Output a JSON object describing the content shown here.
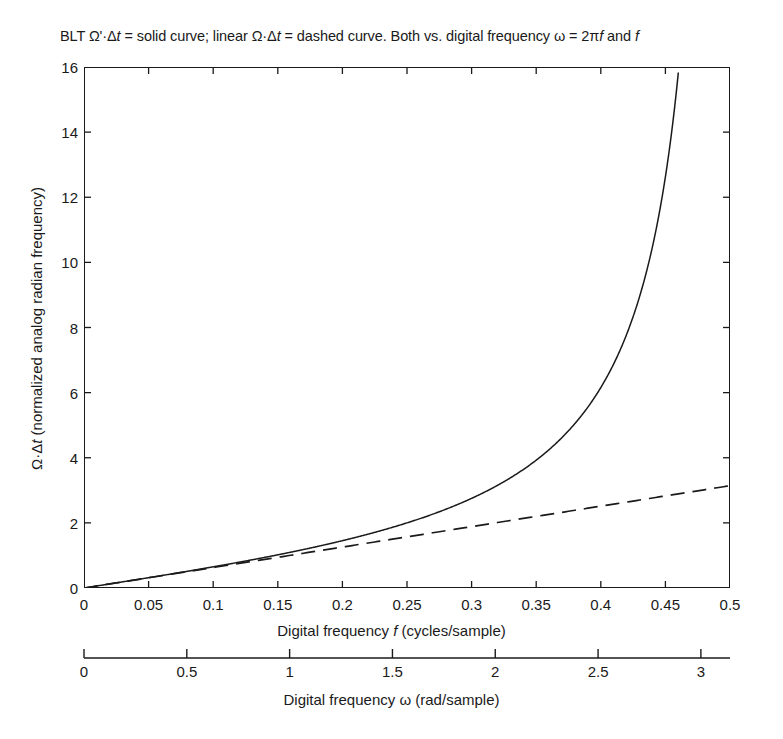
{
  "figure": {
    "top_clipped_text": "",
    "background_color": "#ffffff",
    "line_color": "#1a1a1a"
  },
  "chart_data": {
    "type": "line",
    "title": "BLT Ω'·Δt = solid curve; linear Ω·Δt = dashed curve.  Both vs. digital frequency ω = 2πf and f",
    "title_parts": {
      "prefix": "BLT Ω'·Δ",
      "t1": "t",
      "mid": " = solid curve; linear Ω·Δ",
      "t2": "t",
      "mid2": " = dashed curve.  Both vs. digital frequency ω = 2π",
      "f1": "f",
      "mid3": " and ",
      "f2": "f"
    },
    "xlabel": "Digital frequency f (cycles/sample)",
    "xlabel_parts": {
      "pre": "Digital frequency ",
      "sym": "f",
      "post": " (cycles/sample)"
    },
    "ylabel": "Ω·Δt (normalized analog radian frequency)",
    "ylabel_parts": {
      "pre": "Ω·Δ",
      "sym": "t",
      "post": " (normalized analog radian frequency)"
    },
    "secondary_xlabel": "Digital frequency ω (rad/sample)",
    "xlim": [
      0,
      0.5
    ],
    "ylim": [
      0,
      16
    ],
    "secondary_xlim": [
      0,
      3.14159
    ],
    "grid": false,
    "legend": "none",
    "xticks": [
      "0",
      "0.05",
      "0.1",
      "0.15",
      "0.2",
      "0.25",
      "0.3",
      "0.35",
      "0.4",
      "0.45",
      "0.5"
    ],
    "xtick_values": [
      0,
      0.05,
      0.1,
      0.15,
      0.2,
      0.25,
      0.3,
      0.35,
      0.4,
      0.45,
      0.5
    ],
    "yticks": [
      "0",
      "2",
      "4",
      "6",
      "8",
      "10",
      "12",
      "14",
      "16"
    ],
    "ytick_values": [
      0,
      2,
      4,
      6,
      8,
      10,
      12,
      14,
      16
    ],
    "secondary_xticks": [
      "0",
      "0.5",
      "1",
      "1.5",
      "2",
      "2.5",
      "3"
    ],
    "secondary_xtick_values": [
      0,
      0.5,
      1,
      1.5,
      2,
      2.5,
      3
    ],
    "series": [
      {
        "name": "BLT Ω'·Δt = 2·tan(πf)",
        "style": "solid",
        "formula": "2*tan(pi*f)",
        "x": [
          0,
          0.025,
          0.05,
          0.075,
          0.1,
          0.125,
          0.15,
          0.175,
          0.2,
          0.225,
          0.25,
          0.275,
          0.3,
          0.325,
          0.35,
          0.375,
          0.4,
          0.42,
          0.44,
          0.45,
          0.455,
          0.46,
          0.4648
        ],
        "values": [
          0,
          0.157,
          0.317,
          0.481,
          0.65,
          0.828,
          1.019,
          1.226,
          1.453,
          1.708,
          2.0,
          2.343,
          2.753,
          3.263,
          3.923,
          4.828,
          6.155,
          7.759,
          10.5,
          12.706,
          14.16,
          15.9,
          16.0
        ]
      },
      {
        "name": "linear Ω·Δt = 2πf",
        "style": "dashed",
        "formula": "2*pi*f",
        "x": [
          0,
          0.05,
          0.1,
          0.15,
          0.2,
          0.25,
          0.3,
          0.35,
          0.4,
          0.45,
          0.5
        ],
        "values": [
          0,
          0.314,
          0.628,
          0.942,
          1.257,
          1.571,
          1.885,
          2.199,
          2.513,
          2.827,
          3.142
        ]
      }
    ]
  }
}
